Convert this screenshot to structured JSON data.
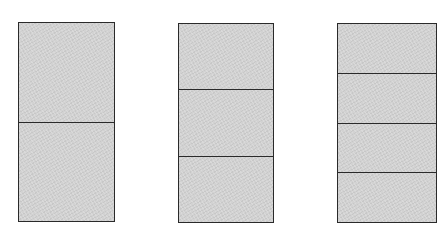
{
  "diagram": {
    "fill_color": "#d2d2d2",
    "stroke_color": "#2a2a2a",
    "rectangles": [
      {
        "id": "halves",
        "parts": 2,
        "x": 18,
        "y": 22,
        "width": 97,
        "height": 200
      },
      {
        "id": "thirds",
        "parts": 3,
        "x": 178,
        "y": 23,
        "width": 96,
        "height": 200
      },
      {
        "id": "fourths",
        "parts": 4,
        "x": 337,
        "y": 23,
        "width": 100,
        "height": 200
      }
    ]
  }
}
